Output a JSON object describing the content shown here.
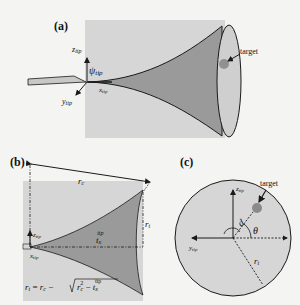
{
  "panels": {
    "a": {
      "label": "(a)",
      "axis_z": "z",
      "axis_z_sub": "tip",
      "axis_y": "y",
      "axis_y_sub": "tip",
      "axis_x": "x",
      "axis_x_sub": "tip",
      "angle": "ψ",
      "angle_sub": "tip",
      "target_label": "target"
    },
    "b": {
      "label": "(b)",
      "rc": "r",
      "rc_sub": "c",
      "rt": "r",
      "rt_sub": "t",
      "tx": "t",
      "tx_sub": "x",
      "tx_sup": "tip",
      "axis_z": "z",
      "axis_z_sub": "tip",
      "axis_x": "x",
      "axis_x_sub": "tip",
      "formula": "r_t = r_c − √(r_c² − t_x^tip)"
    },
    "c": {
      "label": "(c)",
      "axis_z": "z",
      "axis_z_sub": "tip",
      "axis_y": "y",
      "axis_y_sub": "tip",
      "d": "d",
      "theta": "θ",
      "rt": "r",
      "rt_sub": "t",
      "target_label": "target"
    }
  },
  "colors": {
    "panel_bg": "#d6d6d6",
    "cone_fill": "#9a9a9a",
    "cone_face": "#cfcfcf",
    "target": "#8a8a8a",
    "stroke": "#1a1a1a"
  }
}
